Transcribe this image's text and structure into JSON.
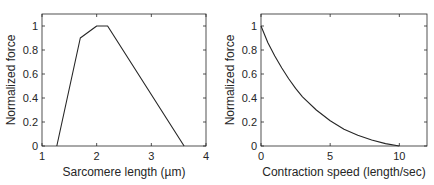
{
  "chart_data": [
    {
      "type": "line",
      "title": "",
      "xlabel": "Sarcomere length (µm)",
      "ylabel": "Normalized force",
      "xlim": [
        1,
        4
      ],
      "ylim": [
        0,
        1.1
      ],
      "xticks": [
        1,
        2,
        3,
        4
      ],
      "yticks": [
        0,
        0.2,
        0.4,
        0.6,
        0.8,
        1
      ],
      "xtick_labels": [
        "1",
        "2",
        "3",
        "4"
      ],
      "ytick_labels": [
        "0",
        "0.2",
        "0.4",
        "0.6",
        "0.8",
        "1"
      ],
      "grid": false,
      "legend": null,
      "series": [
        {
          "name": "force-length",
          "x": [
            1.27,
            1.7,
            2.0,
            2.2,
            3.6
          ],
          "y": [
            0,
            0.9,
            1.0,
            1.0,
            0
          ]
        }
      ]
    },
    {
      "type": "line",
      "title": "",
      "xlabel": "Contraction speed (length/sec)",
      "ylabel": "Normalized force",
      "xlim": [
        0,
        12
      ],
      "ylim": [
        0,
        1.1
      ],
      "xticks": [
        0,
        5,
        10
      ],
      "yticks": [
        0,
        0.2,
        0.4,
        0.6,
        0.8,
        1
      ],
      "xtick_labels": [
        "0",
        "5",
        "10"
      ],
      "ytick_labels": [
        "0",
        "0.2",
        "0.4",
        "0.6",
        "0.8",
        "1"
      ],
      "grid": false,
      "legend": null,
      "series": [
        {
          "name": "force-velocity",
          "x": [
            0,
            0.5,
            1,
            1.5,
            2,
            2.5,
            3,
            4,
            5,
            6,
            7,
            8,
            9,
            10
          ],
          "y": [
            1.0,
            0.86,
            0.75,
            0.65,
            0.56,
            0.48,
            0.41,
            0.3,
            0.21,
            0.14,
            0.09,
            0.05,
            0.02,
            0.0
          ]
        }
      ]
    }
  ]
}
